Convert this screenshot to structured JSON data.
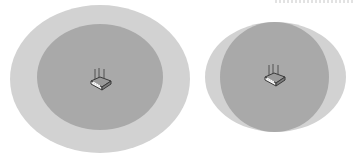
{
  "diagram": {
    "type": "wifi-coverage-comparison",
    "colors": {
      "background": "#ffffff",
      "outer_zone": "#d2d2d2",
      "inner_zone": "#a9a9a9",
      "router_stroke": "#3a3a3a",
      "router_highlight": "#f2f2f2"
    },
    "figures": [
      {
        "name": "left",
        "outer": {
          "left": 10,
          "top": 5,
          "width": 180,
          "height": 148
        },
        "inner": {
          "left": 37,
          "top": 24,
          "width": 126,
          "height": 106
        },
        "router": {
          "left": 88,
          "top": 67,
          "icon": "router-icon"
        }
      },
      {
        "name": "right",
        "outer": {
          "left": 205,
          "top": 22,
          "width": 141,
          "height": 110
        },
        "inner": {
          "left": 220,
          "top": 22,
          "width": 109,
          "height": 110
        },
        "router": {
          "left": 262,
          "top": 63,
          "icon": "router-icon"
        }
      }
    ]
  }
}
